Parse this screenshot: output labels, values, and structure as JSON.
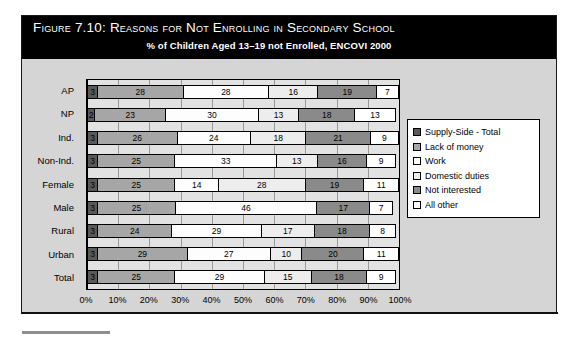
{
  "figure": {
    "number": "Figure 7.10:",
    "title": "Reasons for Not Enrolling in Secondary School",
    "subtitle": "% of Children Aged 13–19 not Enrolled, ENCOVI 2000"
  },
  "legend": {
    "items": [
      {
        "label": "Supply-Side - Total",
        "fill": "#595959"
      },
      {
        "label": "Lack of money",
        "fill": "#a6a6a6"
      },
      {
        "label": "Work",
        "fill": "#fdfdfd"
      },
      {
        "label": "Domestic duties",
        "fill": "#ededed"
      },
      {
        "label": "Not interested",
        "fill": "#8a8a8a"
      },
      {
        "label": "All other",
        "fill": "#ffffff"
      }
    ]
  },
  "axis": {
    "ticks": [
      "0%",
      "10%",
      "20%",
      "30%",
      "40%",
      "50%",
      "60%",
      "70%",
      "80%",
      "90%",
      "100%"
    ]
  },
  "chart_data": {
    "type": "bar",
    "orientation": "horizontal",
    "stacked": true,
    "title": "Reasons for Not Enrolling in Secondary School",
    "subtitle": "% of Children Aged 13–19 not Enrolled, ENCOVI 2000",
    "xlabel": "",
    "ylabel": "",
    "xlim": [
      0,
      100
    ],
    "xticks": [
      0,
      10,
      20,
      30,
      40,
      50,
      60,
      70,
      80,
      90,
      100
    ],
    "grid": true,
    "legend_position": "right",
    "categories": [
      "AP",
      "NP",
      "Ind.",
      "Non-Ind.",
      "Female",
      "Male",
      "Rural",
      "Urban",
      "Total"
    ],
    "series": [
      {
        "name": "Supply-Side - Total",
        "values": [
          3,
          2,
          3,
          3,
          3,
          3,
          3,
          3,
          3
        ]
      },
      {
        "name": "Lack of money",
        "values": [
          28,
          23,
          26,
          25,
          25,
          25,
          24,
          29,
          25
        ]
      },
      {
        "name": "Work",
        "values": [
          28,
          30,
          24,
          33,
          14,
          46,
          29,
          27,
          29
        ]
      },
      {
        "name": "Domestic duties",
        "values": [
          16,
          13,
          18,
          13,
          28,
          0,
          17,
          10,
          15
        ]
      },
      {
        "name": "Not interested",
        "values": [
          19,
          18,
          21,
          16,
          19,
          17,
          18,
          20,
          18
        ]
      },
      {
        "name": "All other",
        "values": [
          7,
          13,
          9,
          9,
          11,
          7,
          8,
          11,
          9
        ]
      }
    ]
  }
}
